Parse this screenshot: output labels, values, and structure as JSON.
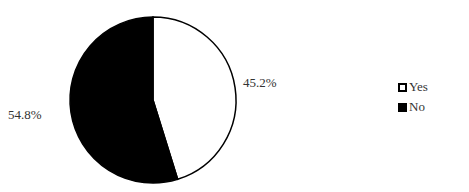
{
  "chart_data": {
    "type": "pie",
    "title": "",
    "categories": [
      "Yes",
      "No"
    ],
    "values": [
      45.2,
      54.8
    ],
    "labels": [
      "45.2%",
      "54.8%"
    ],
    "colors": [
      "#ffffff",
      "#000000"
    ],
    "legend_position": "right"
  },
  "legend": {
    "items": [
      {
        "label": "Yes",
        "color": "#ffffff"
      },
      {
        "label": "No",
        "color": "#000000"
      }
    ]
  }
}
